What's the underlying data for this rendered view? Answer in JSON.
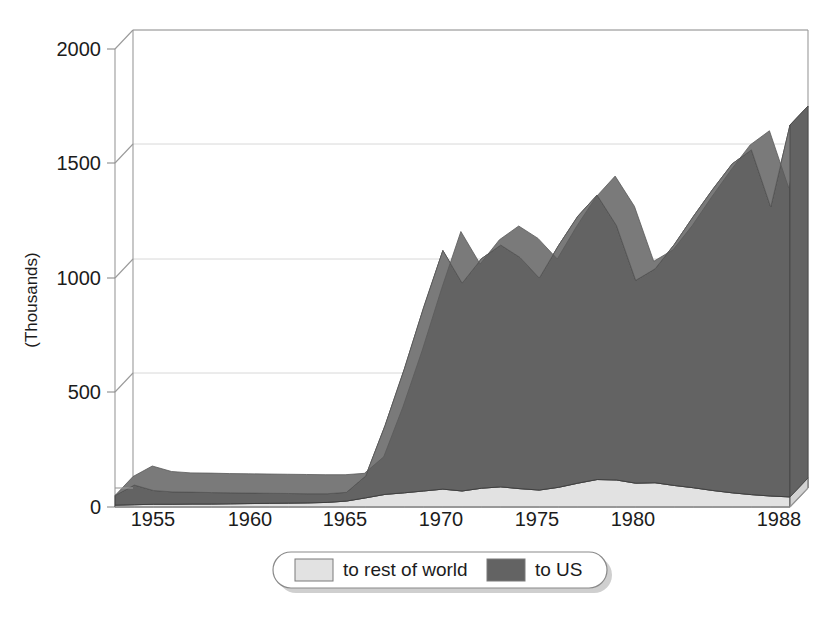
{
  "chart_data": {
    "type": "area",
    "stacked": true,
    "title": "",
    "xlabel": "",
    "ylabel": "(Thousands)",
    "ylim": [
      0,
      2000
    ],
    "yticks": [
      0,
      500,
      1000,
      1500,
      2000
    ],
    "ytick_labels": [
      "0",
      "500",
      "1000",
      "1500",
      "2000"
    ],
    "xlim": [
      1953,
      1988
    ],
    "xticks": [
      1955,
      1960,
      1965,
      1970,
      1975,
      1980,
      1988
    ],
    "xtick_labels": [
      "1955",
      "1960",
      "1965",
      "1970",
      "1975",
      "1980",
      "1988"
    ],
    "grid": true,
    "grid_axis": "y",
    "legend_position": "bottom",
    "x": [
      1953,
      1954,
      1955,
      1956,
      1957,
      1958,
      1959,
      1960,
      1961,
      1962,
      1963,
      1964,
      1965,
      1966,
      1967,
      1968,
      1969,
      1970,
      1971,
      1972,
      1973,
      1974,
      1975,
      1976,
      1977,
      1978,
      1979,
      1980,
      1981,
      1982,
      1983,
      1984,
      1985,
      1986,
      1987,
      1988
    ],
    "series": [
      {
        "name": "to rest of world",
        "color": "#e2e2e2",
        "values": [
          8,
          10,
          12,
          12,
          13,
          13,
          14,
          15,
          16,
          17,
          18,
          20,
          26,
          40,
          55,
          62,
          70,
          78,
          70,
          82,
          88,
          80,
          74,
          86,
          104,
          120,
          118,
          104,
          106,
          94,
          84,
          72,
          62,
          54,
          48,
          44
        ]
      },
      {
        "name": "to US",
        "color": "#636363",
        "values": [
          42,
          86,
          60,
          54,
          52,
          50,
          48,
          46,
          44,
          42,
          40,
          38,
          38,
          96,
          300,
          540,
          800,
          1042,
          908,
          1002,
          1056,
          1010,
          926,
          1056,
          1166,
          1242,
          1112,
          886,
          934,
          1052,
          1186,
          1316,
          1436,
          1506,
          1262,
          1624
        ]
      }
    ],
    "totals_note": "stacked totals: rest-of-world at bottom, to-US on top"
  },
  "axis": {
    "y_label": "(Thousands)",
    "y_ticks": [
      "2000",
      "1500",
      "1000",
      "500",
      "0"
    ],
    "x_ticks": [
      "1955",
      "1960",
      "1965",
      "1970",
      "1975",
      "1980",
      "1988"
    ]
  },
  "legend": {
    "items": [
      {
        "label": "to rest of world",
        "swatch": "light-swatch",
        "color": "#e2e2e2"
      },
      {
        "label": "to US",
        "swatch": "dark-swatch",
        "color": "#636363"
      }
    ]
  },
  "colors": {
    "series_light": "#e2e2e2",
    "series_dark": "#636363",
    "series_dark_side": "#4e4e4e",
    "series_light_side": "#c9c9c9",
    "frame": "#9a9a9a",
    "grid": "#d8d8d8",
    "text": "#1c1c1c"
  }
}
